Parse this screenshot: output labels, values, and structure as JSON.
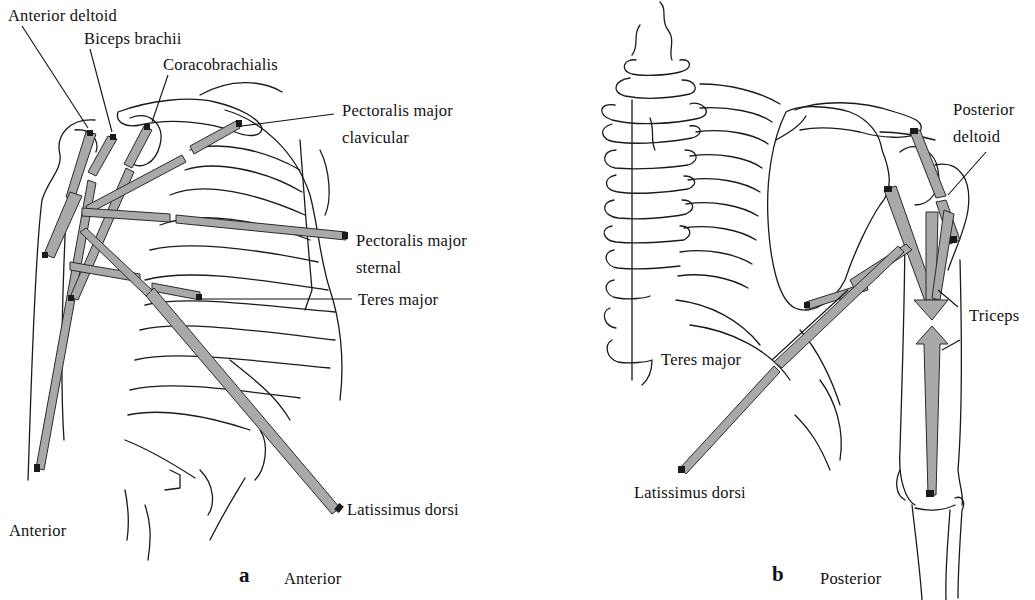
{
  "figure": {
    "panels": [
      {
        "id": "a",
        "letter": "a",
        "view": "Anterior",
        "corner_label": "Anterior",
        "muscle_labels": [
          "Anterior deltoid",
          "Biceps brachii",
          "Coracobrachialis",
          "Pectoralis major",
          "clavicular",
          "Pectoralis major",
          "sternal",
          "Teres major",
          "Latissimus dorsi"
        ]
      },
      {
        "id": "b",
        "letter": "b",
        "view": "Posterior",
        "muscle_labels": [
          "Posterior",
          "deltoid",
          "Triceps",
          "Teres major",
          "Latissimus dorsi"
        ]
      }
    ],
    "colors": {
      "muscle_arrow_fill": "#a9a9a9",
      "line_art": "#1a1a1a",
      "background": "#ffffff"
    }
  }
}
